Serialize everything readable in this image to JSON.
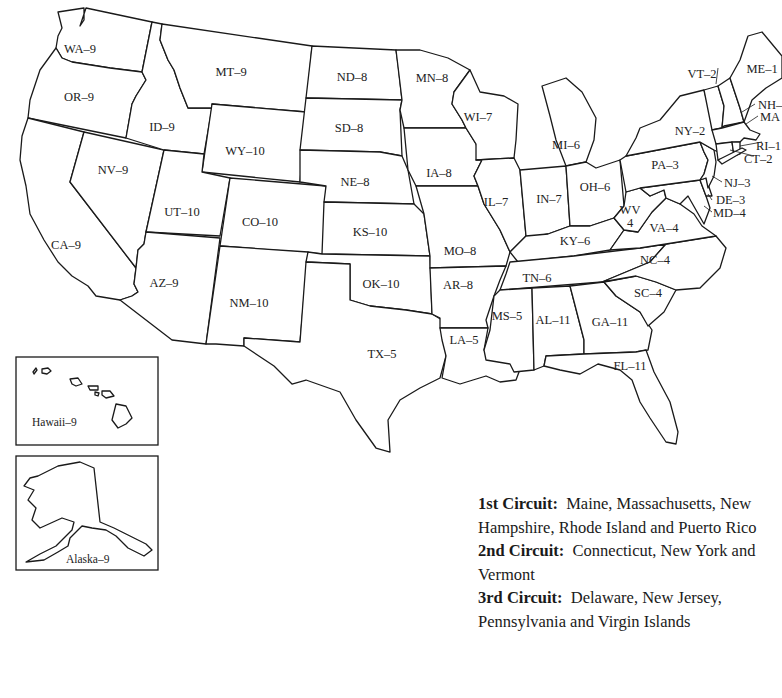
{
  "map": {
    "title": "U.S. Federal Judicial Circuits by State",
    "states": [
      {
        "abbr": "WA",
        "circuit": "9",
        "label": "WA–9"
      },
      {
        "abbr": "OR",
        "circuit": "9",
        "label": "OR–9"
      },
      {
        "abbr": "CA",
        "circuit": "9",
        "label": "CA–9"
      },
      {
        "abbr": "ID",
        "circuit": "9",
        "label": "ID–9"
      },
      {
        "abbr": "NV",
        "circuit": "9",
        "label": "NV–9"
      },
      {
        "abbr": "MT",
        "circuit": "9",
        "label": "MT–9"
      },
      {
        "abbr": "WY",
        "circuit": "10",
        "label": "WY–10"
      },
      {
        "abbr": "UT",
        "circuit": "10",
        "label": "UT–10"
      },
      {
        "abbr": "AZ",
        "circuit": "9",
        "label": "AZ–9"
      },
      {
        "abbr": "CO",
        "circuit": "10",
        "label": "CO–10"
      },
      {
        "abbr": "NM",
        "circuit": "10",
        "label": "NM–10"
      },
      {
        "abbr": "ND",
        "circuit": "8",
        "label": "ND–8"
      },
      {
        "abbr": "SD",
        "circuit": "8",
        "label": "SD–8"
      },
      {
        "abbr": "NE",
        "circuit": "8",
        "label": "NE–8"
      },
      {
        "abbr": "KS",
        "circuit": "10",
        "label": "KS–10"
      },
      {
        "abbr": "OK",
        "circuit": "10",
        "label": "OK–10"
      },
      {
        "abbr": "TX",
        "circuit": "5",
        "label": "TX–5"
      },
      {
        "abbr": "MN",
        "circuit": "8",
        "label": "MN–8"
      },
      {
        "abbr": "IA",
        "circuit": "8",
        "label": "IA–8"
      },
      {
        "abbr": "MO",
        "circuit": "8",
        "label": "MO–8"
      },
      {
        "abbr": "AR",
        "circuit": "8",
        "label": "AR–8"
      },
      {
        "abbr": "LA",
        "circuit": "5",
        "label": "LA–5"
      },
      {
        "abbr": "WI",
        "circuit": "7",
        "label": "WI–7"
      },
      {
        "abbr": "IL",
        "circuit": "7",
        "label": "IL–7"
      },
      {
        "abbr": "MI",
        "circuit": "6",
        "label": "MI–6"
      },
      {
        "abbr": "IN",
        "circuit": "7",
        "label": "IN–7"
      },
      {
        "abbr": "OH",
        "circuit": "6",
        "label": "OH–6"
      },
      {
        "abbr": "KY",
        "circuit": "6",
        "label": "KY–6"
      },
      {
        "abbr": "TN",
        "circuit": "6",
        "label": "TN–6"
      },
      {
        "abbr": "MS",
        "circuit": "5",
        "label": "MS–5"
      },
      {
        "abbr": "AL",
        "circuit": "11",
        "label": "AL–11"
      },
      {
        "abbr": "GA",
        "circuit": "11",
        "label": "GA–11"
      },
      {
        "abbr": "FL",
        "circuit": "11",
        "label": "FL–11"
      },
      {
        "abbr": "SC",
        "circuit": "4",
        "label": "SC–4"
      },
      {
        "abbr": "NC",
        "circuit": "4",
        "label": "NC–4"
      },
      {
        "abbr": "VA",
        "circuit": "4",
        "label": "VA–4"
      },
      {
        "abbr": "WV",
        "circuit": "4",
        "label_line1": "WV",
        "label_line2": "4"
      },
      {
        "abbr": "PA",
        "circuit": "3",
        "label": "PA–3"
      },
      {
        "abbr": "NY",
        "circuit": "2",
        "label": "NY–2"
      },
      {
        "abbr": "VT",
        "circuit": "2",
        "label": "VT–2"
      },
      {
        "abbr": "ME",
        "circuit": "1",
        "label": "ME–1"
      },
      {
        "abbr": "NH",
        "circuit": "1",
        "label": "NH–"
      },
      {
        "abbr": "MA",
        "circuit": "1",
        "label": "MA"
      },
      {
        "abbr": "RI",
        "circuit": "1",
        "label": "RI–1"
      },
      {
        "abbr": "CT",
        "circuit": "2",
        "label": "CT–2"
      },
      {
        "abbr": "NJ",
        "circuit": "3",
        "label": "NJ–3"
      },
      {
        "abbr": "DE",
        "circuit": "3",
        "label": "DE–3"
      },
      {
        "abbr": "MD",
        "circuit": "4",
        "label": "MD–4"
      }
    ],
    "insets": {
      "hawaii": {
        "label": "Hawaii–9"
      },
      "alaska": {
        "label": "Alaska–9"
      }
    }
  },
  "legend": {
    "items": [
      {
        "heading": "1st Circuit:",
        "text": "Maine, Massachusetts, New Hampshire, Rhode Island and Puerto Rico"
      },
      {
        "heading": "2nd Circuit:",
        "text": "Connecticut, New York and Vermont"
      },
      {
        "heading": "3rd Circuit:",
        "text": "Delaware, New Jersey, Pennsylvania and Virgin Islands"
      }
    ]
  }
}
